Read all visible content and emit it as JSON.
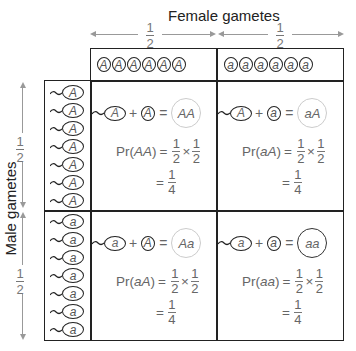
{
  "female_axis": {
    "label": "Female gametes",
    "fractions": [
      {
        "num": "1",
        "den": "2"
      },
      {
        "num": "1",
        "den": "2"
      }
    ]
  },
  "male_axis": {
    "label": "Male gametes",
    "fractions": [
      {
        "num": "1",
        "den": "2"
      },
      {
        "num": "1",
        "den": "2"
      }
    ]
  },
  "eggs": {
    "left": [
      "A",
      "A",
      "A",
      "A",
      "A",
      "A"
    ],
    "right": [
      "a",
      "a",
      "a",
      "a",
      "a",
      "a"
    ]
  },
  "sperm": {
    "top": [
      "A",
      "A",
      "A",
      "A",
      "A",
      "A",
      "A"
    ],
    "bottom": [
      "a",
      "a",
      "a",
      "a",
      "a",
      "a",
      "a"
    ]
  },
  "cells": [
    {
      "sperm": "A",
      "plus": "+",
      "egg": "A",
      "equals": "=",
      "zygote": "AA",
      "pr_prefix": "Pr(",
      "pr_geno": "AA",
      "pr_suffix": ")",
      "eq1": "=",
      "f1n": "1",
      "f1d": "2",
      "times": "×",
      "f2n": "1",
      "f2d": "2",
      "eq2": "=",
      "rn": "1",
      "rd": "4",
      "zygote_dark": false
    },
    {
      "sperm": "A",
      "plus": "+",
      "egg": "a",
      "equals": "=",
      "zygote": "aA",
      "pr_prefix": "Pr(",
      "pr_geno": "aA",
      "pr_suffix": ")",
      "eq1": "=",
      "f1n": "1",
      "f1d": "2",
      "times": "×",
      "f2n": "1",
      "f2d": "2",
      "eq2": "=",
      "rn": "1",
      "rd": "4",
      "zygote_dark": false
    },
    {
      "sperm": "a",
      "plus": "+",
      "egg": "A",
      "equals": "=",
      "zygote": "Aa",
      "pr_prefix": "Pr(",
      "pr_geno": "aA",
      "pr_suffix": ")",
      "eq1": "=",
      "f1n": "1",
      "f1d": "2",
      "times": "×",
      "f2n": "1",
      "f2d": "2",
      "eq2": "=",
      "rn": "1",
      "rd": "4",
      "zygote_dark": false
    },
    {
      "sperm": "a",
      "plus": "+",
      "egg": "a",
      "equals": "=",
      "zygote": "aa",
      "pr_prefix": "Pr(",
      "pr_geno": "aa",
      "pr_suffix": ")",
      "eq1": "=",
      "f1n": "1",
      "f1d": "2",
      "times": "×",
      "f2n": "1",
      "f2d": "2",
      "eq2": "=",
      "rn": "1",
      "rd": "4",
      "zygote_dark": true
    }
  ]
}
